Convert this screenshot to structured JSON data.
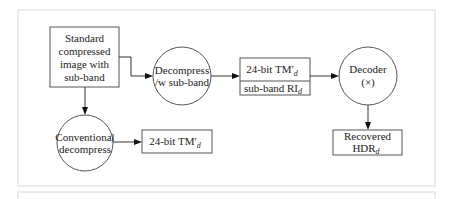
{
  "diagram": {
    "nodes": {
      "standard": {
        "shape": "rect",
        "lines": [
          "Standard",
          "compressed",
          "image with",
          "sub-band"
        ]
      },
      "decompress_sub": {
        "shape": "circle",
        "lines": [
          "Decompress",
          "/w sub-band"
        ]
      },
      "tm_sub_top": {
        "shape": "rect",
        "main": "24-bit TM",
        "prime": "′",
        "sub": "d"
      },
      "tm_sub_bottom": {
        "shape": "rect",
        "main": "sub-band RI",
        "sub": "d"
      },
      "decoder": {
        "shape": "circle",
        "lines": [
          "Decoder",
          "(×)"
        ]
      },
      "recovered": {
        "shape": "rect",
        "line1": "Recovered",
        "main": "HDR",
        "sub": "d"
      },
      "conventional": {
        "shape": "circle",
        "lines": [
          "Conventional",
          "decompress"
        ]
      },
      "tm_plain": {
        "shape": "rect",
        "main": "24-bit TM",
        "prime": "′",
        "sub": "d"
      }
    },
    "edges": [
      {
        "from": "standard",
        "to": "decompress_sub"
      },
      {
        "from": "decompress_sub",
        "to": "tm_sub_top"
      },
      {
        "from": "tm_sub_top",
        "to": "decoder"
      },
      {
        "from": "decoder",
        "to": "recovered"
      },
      {
        "from": "standard",
        "to": "conventional"
      },
      {
        "from": "conventional",
        "to": "tm_plain"
      }
    ]
  }
}
